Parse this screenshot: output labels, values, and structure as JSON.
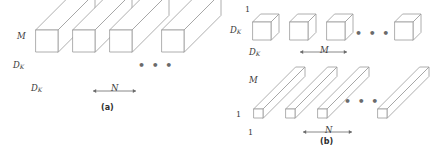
{
  "figure": {
    "background": "#ffffff",
    "line_color": "#9a9a9a",
    "face_color": "#ffffff",
    "text_color": "#3b3b3b",
    "ellipsis": "• • •"
  },
  "panel_a": {
    "caption": "(a)",
    "label_depth": "M",
    "label_height": "D",
    "label_height_sub": "K",
    "label_width": "D",
    "label_width_sub": "K",
    "count_arrow_label": "N",
    "arrow_left": "←",
    "arrow_right": "→",
    "shapes": [
      {
        "kind": "box",
        "x": 36,
        "y": 52
      },
      {
        "kind": "box",
        "x": 73,
        "y": 52
      },
      {
        "kind": "box",
        "x": 110,
        "y": 52
      },
      {
        "kind": "box",
        "x": 162,
        "y": 52
      }
    ],
    "ellipsis_x": 140,
    "ellipsis_y": 64
  },
  "panel_b": {
    "caption": "(b)",
    "top_row": {
      "label_depth": "1",
      "label_height": "D",
      "label_height_sub": "K",
      "label_width": "D",
      "label_width_sub": "K",
      "count_arrow_label": "M",
      "shapes": [
        {
          "kind": "cube",
          "x": 253,
          "y": 40
        },
        {
          "kind": "cube",
          "x": 290,
          "y": 40
        },
        {
          "kind": "cube",
          "x": 327,
          "y": 40
        },
        {
          "kind": "cube",
          "x": 395,
          "y": 40
        }
      ],
      "ellipsis_x": 360,
      "ellipsis_y": 32
    },
    "bottom_row": {
      "label_depth": "M",
      "label_height": "1",
      "label_width": "1",
      "count_arrow_label": "N",
      "shapes": [
        {
          "kind": "bar",
          "x": 254,
          "y": 118
        },
        {
          "kind": "bar",
          "x": 286,
          "y": 118
        },
        {
          "kind": "bar",
          "x": 318,
          "y": 118
        },
        {
          "kind": "bar",
          "x": 378,
          "y": 118
        }
      ],
      "ellipsis_x": 348,
      "ellipsis_y": 100
    },
    "arrow_left": "←",
    "arrow_right": "→"
  }
}
